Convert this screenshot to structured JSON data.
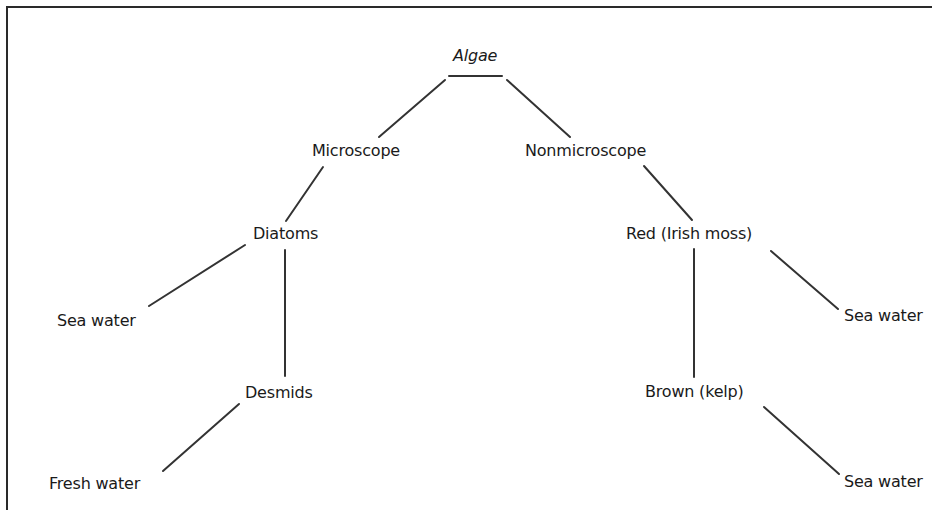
{
  "diagram": {
    "type": "tree",
    "title": "Algae",
    "colors": {
      "line": "#333333",
      "text": "#1a1a1a",
      "background": "#ffffff",
      "frame": "#2a2a2a"
    },
    "nodes": {
      "root": {
        "label": "Algae",
        "style": "italic"
      },
      "microscope": {
        "label": "Microscope"
      },
      "nonmicroscope": {
        "label": "Nonmicroscope"
      },
      "diatoms": {
        "label": "Diatoms"
      },
      "diatoms_habitat": {
        "label": "Sea water"
      },
      "desmids": {
        "label": "Desmids"
      },
      "desmids_habitat": {
        "label": "Fresh water"
      },
      "red": {
        "label": "Red (Irish moss)"
      },
      "red_habitat": {
        "label": "Sea water"
      },
      "brown": {
        "label": "Brown (kelp)"
      },
      "brown_habitat": {
        "label": "Sea water"
      }
    },
    "edges": [
      {
        "from": "root",
        "to": "microscope"
      },
      {
        "from": "root",
        "to": "nonmicroscope"
      },
      {
        "from": "microscope",
        "to": "diatoms"
      },
      {
        "from": "diatoms",
        "to": "diatoms_habitat"
      },
      {
        "from": "diatoms",
        "to": "desmids"
      },
      {
        "from": "desmids",
        "to": "desmids_habitat"
      },
      {
        "from": "nonmicroscope",
        "to": "red"
      },
      {
        "from": "red",
        "to": "brown"
      },
      {
        "from": "red",
        "to": "red_habitat"
      },
      {
        "from": "brown",
        "to": "brown_habitat"
      }
    ]
  }
}
